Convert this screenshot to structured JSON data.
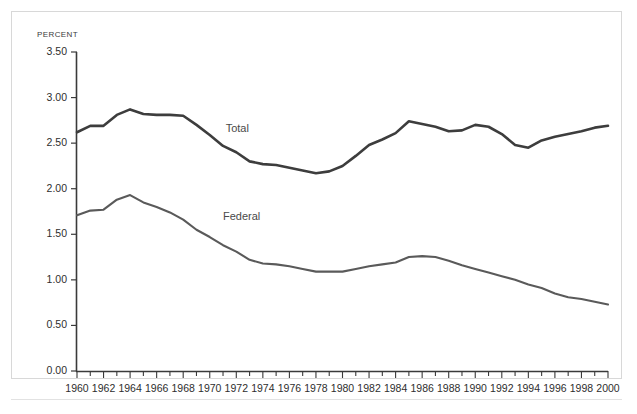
{
  "chart_data": {
    "type": "line",
    "title": "",
    "subtitle": "",
    "xlabel": "",
    "ylabel": "PERCENT",
    "unit_label": "PERCENT",
    "xlim": [
      1960,
      2000
    ],
    "ylim": [
      0.0,
      3.5
    ],
    "grid": false,
    "legend_position": "inline-annotation",
    "y_ticks": [
      "0.00",
      "0.50",
      "1.00",
      "1.50",
      "2.00",
      "2.50",
      "3.00",
      "3.50"
    ],
    "y_tick_values": [
      0.0,
      0.5,
      1.0,
      1.5,
      2.0,
      2.5,
      3.0,
      3.5
    ],
    "x_tick_labels": [
      "1960",
      "1962",
      "1964",
      "1966",
      "1968",
      "1970",
      "1972",
      "1974",
      "1976",
      "1978",
      "1980",
      "1982",
      "1984",
      "1986",
      "1988",
      "1990",
      "1992",
      "1994",
      "1996",
      "1998",
      "2000"
    ],
    "x_tick_values": [
      1960,
      1962,
      1964,
      1966,
      1968,
      1970,
      1972,
      1974,
      1976,
      1978,
      1980,
      1982,
      1984,
      1986,
      1988,
      1990,
      1992,
      1994,
      1996,
      1998,
      2000
    ],
    "x_minor_ticks_every": 1,
    "x": [
      1960,
      1961,
      1962,
      1963,
      1964,
      1965,
      1966,
      1967,
      1968,
      1969,
      1970,
      1971,
      1972,
      1973,
      1974,
      1975,
      1976,
      1977,
      1978,
      1979,
      1980,
      1981,
      1982,
      1983,
      1984,
      1985,
      1986,
      1987,
      1988,
      1989,
      1990,
      1991,
      1992,
      1993,
      1994,
      1995,
      1996,
      1997,
      1998,
      1999,
      2000
    ],
    "series": [
      {
        "name": "Total",
        "color": "#3d3d3d",
        "line_width": 2.6,
        "label_x": 1971.2,
        "label_y": 2.66,
        "values": [
          2.62,
          2.69,
          2.69,
          2.81,
          2.87,
          2.82,
          2.81,
          2.81,
          2.8,
          2.7,
          2.59,
          2.47,
          2.4,
          2.3,
          2.27,
          2.26,
          2.23,
          2.2,
          2.17,
          2.19,
          2.25,
          2.36,
          2.48,
          2.54,
          2.61,
          2.74,
          2.71,
          2.68,
          2.63,
          2.64,
          2.7,
          2.68,
          2.6,
          2.48,
          2.45,
          2.53,
          2.57,
          2.6,
          2.63,
          2.67,
          2.69
        ]
      },
      {
        "name": "Federal",
        "color": "#5a5a5a",
        "line_width": 2.1,
        "label_x": 1971.0,
        "label_y": 1.69,
        "values": [
          1.71,
          1.76,
          1.77,
          1.88,
          1.93,
          1.85,
          1.8,
          1.74,
          1.66,
          1.55,
          1.47,
          1.38,
          1.31,
          1.22,
          1.18,
          1.17,
          1.15,
          1.12,
          1.09,
          1.09,
          1.09,
          1.12,
          1.15,
          1.17,
          1.19,
          1.25,
          1.26,
          1.25,
          1.21,
          1.16,
          1.12,
          1.08,
          1.04,
          1.0,
          0.95,
          0.91,
          0.85,
          0.81,
          0.79,
          0.76,
          0.73
        ]
      }
    ]
  }
}
